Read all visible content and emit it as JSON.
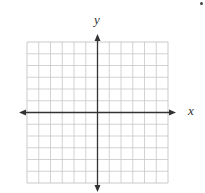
{
  "diagram": {
    "type": "coordinate-grid",
    "grid": {
      "columns": 12,
      "rows": 12,
      "left": 27,
      "top": 42,
      "cell_size": 11.75,
      "line_color": "#c8c8c8",
      "border_color": "#bdbdbd"
    },
    "axes": {
      "color": "#333333",
      "x_label": "x",
      "y_label": "y",
      "origin_column": 6,
      "origin_row": 6,
      "arrows": [
        "left",
        "right",
        "up",
        "down"
      ]
    }
  },
  "chart_data": {
    "type": "scatter",
    "title": "",
    "xlabel": "x",
    "ylabel": "y",
    "xlim": [
      -6,
      6
    ],
    "ylim": [
      -6,
      6
    ],
    "grid": true,
    "series": [],
    "tick_labels": false
  }
}
